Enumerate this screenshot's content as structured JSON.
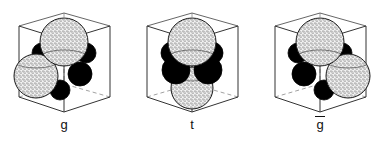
{
  "figure": {
    "type": "molecular-conformation-diagram",
    "background_color": "#ffffff",
    "line_color": "#333333",
    "dashed_edge_color": "#777777",
    "stipple_sphere_fill": "#f2f2f2",
    "stipple_dot_color": "#2b2b2b",
    "black_sphere_fill": "#000000",
    "outline_color": "#1a1a1a",
    "panel_count": 3
  },
  "panels": [
    {
      "id": "panel-g",
      "label": "g",
      "overbar": false,
      "description": "Cubic cell with one large stippled sphere at upper center and one large stippled sphere at lower left, four small black spheres clustered about the cube center",
      "cube": {
        "front_top": [
          64,
          40
        ],
        "left_top": [
          19,
          26
        ],
        "right_top": [
          110,
          26
        ],
        "back_top": [
          64,
          13
        ],
        "front_bottom": [
          64,
          112
        ],
        "left_bottom": [
          19,
          97
        ],
        "right_bottom": [
          110,
          97
        ],
        "back_bottom": [
          64,
          84
        ]
      },
      "spheres": [
        {
          "kind": "stipple",
          "cx": 64,
          "cy": 42,
          "r": 24,
          "z": 3
        },
        {
          "kind": "stipple",
          "cx": 36,
          "cy": 76,
          "r": 22,
          "z": 2
        },
        {
          "kind": "black",
          "cx": 42,
          "cy": 53,
          "r": 10,
          "z": 1
        },
        {
          "kind": "black",
          "cx": 86,
          "cy": 53,
          "r": 10,
          "z": 1
        },
        {
          "kind": "black",
          "cx": 80,
          "cy": 74,
          "r": 12,
          "z": 1
        },
        {
          "kind": "black",
          "cx": 60,
          "cy": 90,
          "r": 10,
          "z": 1
        }
      ]
    },
    {
      "id": "panel-t",
      "label": "t",
      "overbar": false,
      "description": "Cubic cell with large stippled spheres vertically aligned at top and bottom centers, four small black spheres in a ring about the cube center",
      "cube": {
        "front_top": [
          64,
          40
        ],
        "left_top": [
          19,
          26
        ],
        "right_top": [
          110,
          26
        ],
        "back_top": [
          64,
          13
        ],
        "front_bottom": [
          64,
          112
        ],
        "left_bottom": [
          19,
          97
        ],
        "right_bottom": [
          110,
          97
        ],
        "back_bottom": [
          64,
          84
        ]
      },
      "spheres": [
        {
          "kind": "stipple",
          "cx": 64,
          "cy": 42,
          "r": 24,
          "z": 3
        },
        {
          "kind": "stipple",
          "cx": 64,
          "cy": 88,
          "r": 21,
          "z": 2
        },
        {
          "kind": "black",
          "cx": 44,
          "cy": 53,
          "r": 11,
          "z": 1
        },
        {
          "kind": "black",
          "cx": 84,
          "cy": 53,
          "r": 11,
          "z": 1
        },
        {
          "kind": "black",
          "cx": 48,
          "cy": 70,
          "r": 14,
          "z": 1
        },
        {
          "kind": "black",
          "cx": 80,
          "cy": 70,
          "r": 14,
          "z": 1
        }
      ]
    },
    {
      "id": "panel-g-bar",
      "label": "g",
      "overbar": true,
      "description": "Mirror image of the g cell: large stippled sphere at upper center and a large stippled sphere at lower right, four small black spheres clustered about the cube center",
      "cube": {
        "front_top": [
          64,
          40
        ],
        "left_top": [
          19,
          26
        ],
        "right_top": [
          110,
          26
        ],
        "back_top": [
          64,
          13
        ],
        "front_bottom": [
          64,
          112
        ],
        "left_bottom": [
          19,
          97
        ],
        "right_bottom": [
          110,
          97
        ],
        "back_bottom": [
          64,
          84
        ]
      },
      "spheres": [
        {
          "kind": "stipple",
          "cx": 64,
          "cy": 42,
          "r": 24,
          "z": 3
        },
        {
          "kind": "stipple",
          "cx": 92,
          "cy": 76,
          "r": 22,
          "z": 2
        },
        {
          "kind": "black",
          "cx": 42,
          "cy": 53,
          "r": 10,
          "z": 1
        },
        {
          "kind": "black",
          "cx": 86,
          "cy": 53,
          "r": 10,
          "z": 1
        },
        {
          "kind": "black",
          "cx": 48,
          "cy": 74,
          "r": 12,
          "z": 1
        },
        {
          "kind": "black",
          "cx": 68,
          "cy": 90,
          "r": 10,
          "z": 1
        }
      ]
    }
  ]
}
